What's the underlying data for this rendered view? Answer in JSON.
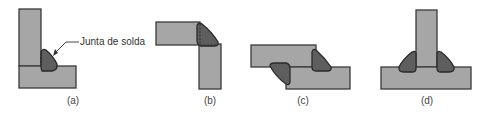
{
  "diagram": {
    "callout_label": "Junta de solda",
    "panels": [
      {
        "id": "a",
        "caption": "(a)",
        "type": "corner-inside fillet"
      },
      {
        "id": "b",
        "caption": "(b)",
        "type": "corner-outside fillet"
      },
      {
        "id": "c",
        "caption": "(c)",
        "type": "lap joint double fillet"
      },
      {
        "id": "d",
        "caption": "(d)",
        "type": "tee joint double fillet"
      }
    ],
    "colors": {
      "plate_fill": "#a6a6a6",
      "weld_fill": "#5e5e5e",
      "outline": "#3a3a3a",
      "background": "#ffffff"
    }
  }
}
